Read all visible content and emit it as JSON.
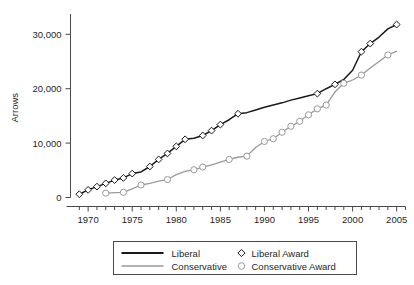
{
  "chart_data": {
    "type": "line",
    "title": "",
    "xlabel": "",
    "ylabel": "Arrows",
    "xlim": [
      1968,
      2006
    ],
    "ylim": [
      0,
      33000
    ],
    "grid": false,
    "legend_position": "bottom-center",
    "y_ticks": [
      0,
      10000,
      20000,
      30000
    ],
    "y_tick_labels": [
      "0",
      "10,000",
      "20,000",
      "30,000"
    ],
    "x_ticks": [
      1970,
      1975,
      1980,
      1985,
      1990,
      1995,
      2000,
      2005
    ],
    "x_tick_labels": [
      "1970",
      "1975",
      "1980",
      "1985",
      "1990",
      "1995",
      "2000",
      "2005"
    ],
    "x_minor_tick_step": 1,
    "series": [
      {
        "name": "Liberal",
        "style": "line",
        "color": "#1a1a1a",
        "x": [
          1969,
          1970,
          1971,
          1972,
          1973,
          1974,
          1975,
          1976,
          1977,
          1978,
          1979,
          1980,
          1981,
          1982,
          1983,
          1984,
          1985,
          1986,
          1987,
          1988,
          1989,
          1990,
          1991,
          1992,
          1993,
          1994,
          1995,
          1996,
          1997,
          1998,
          1999,
          2000,
          2001,
          2002,
          2003,
          2004,
          2005
        ],
        "values": [
          600,
          1400,
          2000,
          2600,
          3200,
          3600,
          4400,
          4700,
          5700,
          7000,
          8100,
          9400,
          10700,
          10900,
          11400,
          12300,
          13400,
          14300,
          15400,
          15600,
          16100,
          16600,
          17000,
          17400,
          17900,
          18300,
          18700,
          19100,
          20000,
          20800,
          21700,
          23400,
          26800,
          28300,
          29500,
          31000,
          31800
        ]
      },
      {
        "name": "Conservative",
        "style": "line",
        "color": "#9a9a9a",
        "x": [
          1972,
          1973,
          1974,
          1975,
          1976,
          1977,
          1978,
          1979,
          1980,
          1981,
          1982,
          1983,
          1984,
          1985,
          1986,
          1987,
          1988,
          1989,
          1990,
          1991,
          1992,
          1993,
          1994,
          1995,
          1996,
          1997,
          1998,
          1999,
          2000,
          2001,
          2002,
          2003,
          2004,
          2005
        ],
        "values": [
          800,
          900,
          950,
          1600,
          2300,
          2600,
          3000,
          3300,
          4200,
          4800,
          5100,
          5600,
          6000,
          6500,
          7000,
          7400,
          7600,
          9200,
          10300,
          10800,
          12000,
          13100,
          14000,
          15200,
          16300,
          17000,
          19400,
          21000,
          21600,
          22500,
          23800,
          25000,
          26200,
          26900
        ]
      }
    ],
    "markers": [
      {
        "name": "Liberal Award",
        "shape": "diamond",
        "stroke": "#1a1a1a",
        "fill": "#ffffff",
        "x": [
          1969,
          1970,
          1971,
          1972,
          1973,
          1974,
          1975,
          1977,
          1978,
          1979,
          1980,
          1981,
          1983,
          1984,
          1985,
          1987,
          1996,
          1998,
          2001,
          2002,
          2005
        ],
        "values": [
          600,
          1400,
          2000,
          2600,
          3200,
          3600,
          4400,
          5700,
          7000,
          8100,
          9400,
          10700,
          11400,
          12300,
          13400,
          15400,
          19100,
          20800,
          26800,
          28300,
          31800
        ]
      },
      {
        "name": "Conservative Award",
        "shape": "circle",
        "stroke": "#9a9a9a",
        "fill": "#ffffff",
        "x": [
          1972,
          1974,
          1976,
          1979,
          1982,
          1983,
          1986,
          1988,
          1990,
          1991,
          1992,
          1993,
          1994,
          1995,
          1996,
          1997,
          1999,
          2001,
          2004
        ],
        "values": [
          800,
          950,
          2300,
          3300,
          5100,
          5600,
          7000,
          7600,
          10300,
          10800,
          12000,
          13100,
          14000,
          15200,
          16300,
          17000,
          21000,
          22500,
          26200
        ]
      }
    ],
    "legend": [
      {
        "label": "Liberal",
        "kind": "line",
        "color": "#1a1a1a"
      },
      {
        "label": "Liberal Award",
        "kind": "diamond",
        "color": "#1a1a1a"
      },
      {
        "label": "Conservative",
        "kind": "line",
        "color": "#9a9a9a"
      },
      {
        "label": "Conservative Award",
        "kind": "circle",
        "color": "#9a9a9a"
      }
    ]
  }
}
